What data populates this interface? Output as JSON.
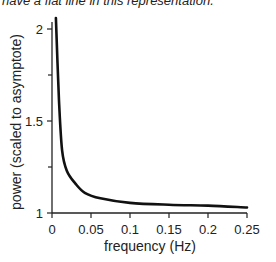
{
  "caption": "have a flat line in this representation.",
  "chart_data": {
    "type": "line",
    "title": "",
    "xlabel": "frequency (Hz)",
    "ylabel": "power (scaled to asymptote)",
    "xlim": [
      0,
      0.25
    ],
    "ylim": [
      1,
      2.08
    ],
    "xticks": [
      "0",
      "0.05",
      "0.1",
      "0.15",
      "0.2",
      "0.25"
    ],
    "yticks": [
      "1",
      "1.5",
      "2"
    ],
    "grid": false,
    "legend": null,
    "series": [
      {
        "name": "power spectrum",
        "x": [
          0.005,
          0.009,
          0.013,
          0.019,
          0.03,
          0.042,
          0.062,
          0.1,
          0.15,
          0.2,
          0.25
        ],
        "y": [
          2.06,
          1.61,
          1.34,
          1.23,
          1.16,
          1.11,
          1.08,
          1.055,
          1.045,
          1.04,
          1.03
        ]
      }
    ]
  }
}
